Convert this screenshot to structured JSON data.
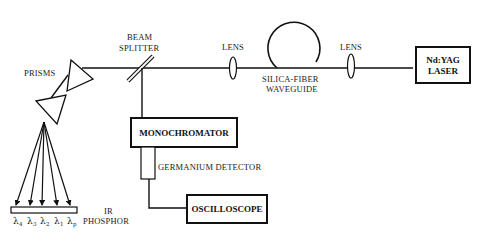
{
  "diagram": {
    "type": "optical-setup",
    "components": {
      "prisms": {
        "label": "PRISMS"
      },
      "beam_splitter": {
        "label_line1": "BEAM",
        "label_line2": "SPLITTER"
      },
      "lens_left": {
        "label": "LENS"
      },
      "fiber": {
        "label_line1": "SILICA-FIBER",
        "label_line2": "WAVEGUIDE"
      },
      "lens_right": {
        "label": "LENS"
      },
      "laser": {
        "label_line1": "Nd:YAG",
        "label_line2": "LASER"
      },
      "monochromator": {
        "label": "MONOCHROMATOR"
      },
      "detector": {
        "label": "GERMANIUM DETECTOR"
      },
      "oscilloscope": {
        "label": "OSCILLOSCOPE"
      },
      "phosphor": {
        "label_line1": "IR",
        "label_line2": "PHOSPHOR"
      }
    },
    "wavelengths": [
      {
        "symbol": "λ",
        "sub": "4"
      },
      {
        "symbol": "λ",
        "sub": "3"
      },
      {
        "symbol": "λ",
        "sub": "2"
      },
      {
        "symbol": "λ",
        "sub": "1"
      },
      {
        "symbol": "λ",
        "sub": "p"
      }
    ],
    "colors": {
      "line": "#111111",
      "background": "#ffffff"
    }
  }
}
